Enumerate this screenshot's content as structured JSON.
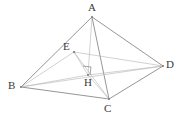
{
  "figure": {
    "name": "solid-geometry-figure",
    "type": "tetrahedron-with-altitude",
    "width": 183,
    "height": 119,
    "background_color": "#ffffff",
    "stroke_color": "#8a8a8a",
    "stroke_color_light": "#b4b4b4",
    "label_color": "#3a3a3a",
    "vertices": [
      {
        "id": "A",
        "label": "A",
        "x": 92,
        "y": 17,
        "label_x": 88,
        "label_y": 2
      },
      {
        "id": "B",
        "label": "B",
        "x": 21,
        "y": 87,
        "label_x": 8,
        "label_y": 80
      },
      {
        "id": "C",
        "label": "C",
        "x": 109,
        "y": 99,
        "label_x": 104,
        "label_y": 103
      },
      {
        "id": "D",
        "label": "D",
        "x": 163,
        "y": 66,
        "label_x": 166,
        "label_y": 59
      },
      {
        "id": "E",
        "label": "E",
        "x": 74,
        "y": 52,
        "label_x": 63,
        "label_y": 41
      },
      {
        "id": "H",
        "label": "H",
        "x": 88,
        "y": 75,
        "label_x": 84,
        "label_y": 77
      }
    ],
    "edges": [
      {
        "from": "A",
        "to": "B",
        "style": "solid"
      },
      {
        "from": "A",
        "to": "C",
        "style": "solid"
      },
      {
        "from": "A",
        "to": "D",
        "style": "solid"
      },
      {
        "from": "B",
        "to": "C",
        "style": "solid"
      },
      {
        "from": "C",
        "to": "D",
        "style": "solid"
      },
      {
        "from": "B",
        "to": "D",
        "style": "thin"
      },
      {
        "from": "A",
        "to": "H",
        "style": "thin"
      },
      {
        "from": "B",
        "to": "H",
        "style": "thin"
      },
      {
        "from": "C",
        "to": "H",
        "style": "thin"
      },
      {
        "from": "D",
        "to": "H",
        "style": "thin"
      },
      {
        "from": "E",
        "to": "B",
        "style": "thin"
      },
      {
        "from": "E",
        "to": "C",
        "style": "thin"
      },
      {
        "from": "E",
        "to": "D",
        "style": "thin"
      },
      {
        "from": "E",
        "to": "H",
        "style": "thin"
      }
    ],
    "right_angle_marker": {
      "at": "H",
      "x": 83,
      "y": 66,
      "size": 8,
      "description": "right-angle-square-at-H"
    }
  }
}
